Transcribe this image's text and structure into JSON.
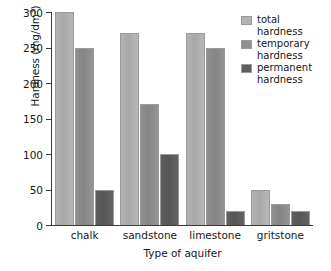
{
  "chart_data": {
    "type": "bar",
    "title": "",
    "xlabel": "Type of aquifer",
    "ylabel": "Hardness (mg/dm3)",
    "ylabel_base": "Hardness (mg/dm",
    "ylabel_sup": "3",
    "ylabel_close": ")",
    "categories": [
      "chalk",
      "sandstone",
      "limestone",
      "gritstone"
    ],
    "series": [
      {
        "name": "total hardness",
        "key": "total",
        "color": "#b3b3b3",
        "values": [
          300,
          270,
          270,
          50
        ]
      },
      {
        "name": "temporary hardness",
        "key": "temporary",
        "color": "#8f8f8f",
        "values": [
          250,
          170,
          250,
          30
        ]
      },
      {
        "name": "permanent hardness",
        "key": "permanent",
        "color": "#5e5e5e",
        "values": [
          50,
          100,
          20,
          20
        ]
      }
    ],
    "ylim": [
      0,
      300
    ],
    "yticks": [
      0,
      50,
      100,
      150,
      200,
      250,
      300
    ],
    "ytick_labels": [
      "0",
      "50",
      "100",
      "150",
      "200",
      "250",
      "300"
    ],
    "grid": false,
    "legend_position": "top-right",
    "legend": [
      {
        "line1": "total",
        "line2": "hardness"
      },
      {
        "line1": "temporary",
        "line2": "hardness"
      },
      {
        "line1": "permanent",
        "line2": "hardness"
      }
    ]
  }
}
